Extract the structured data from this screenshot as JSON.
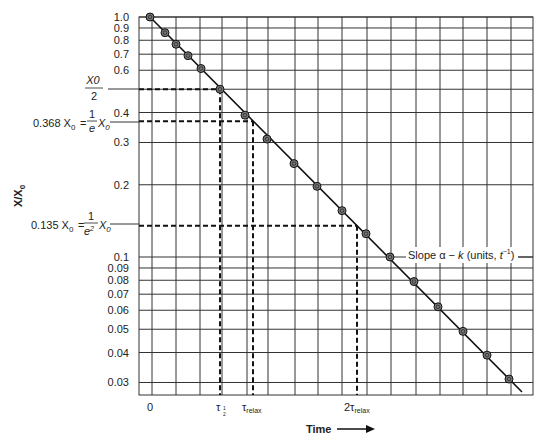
{
  "chart_data": {
    "type": "line",
    "title": "",
    "xlabel": "Time",
    "ylabel": "X/X0",
    "yscale": "log",
    "ylim": [
      0.027,
      1.0
    ],
    "grid": true,
    "y_ticks": [
      "1.0",
      "0.9",
      "0.8",
      "0.7",
      "0.6",
      "0.4",
      "0.3",
      "0.2",
      "0.1",
      "0.09",
      "0.08",
      "0.07",
      "0.06",
      "0.05",
      "0.04",
      "0.03"
    ],
    "y_tick_values": [
      1.0,
      0.9,
      0.8,
      0.7,
      0.6,
      0.4,
      0.3,
      0.2,
      0.1,
      0.09,
      0.08,
      0.07,
      0.06,
      0.05,
      0.04,
      0.03
    ],
    "x_ticks": [
      "0",
      "τ1/2",
      "τrelax",
      "2τrelax"
    ],
    "annotations": {
      "half": {
        "label_num": "X0",
        "label_den": "2",
        "value": 0.5
      },
      "one_over_e": {
        "prefix": "0.368 X",
        "sub": "0",
        "eq": "=",
        "frac_num": "1",
        "frac_den": "e",
        "suffix": "X",
        "suffix_sub": "0",
        "value": 0.368
      },
      "one_over_e2": {
        "prefix": "0.135 X",
        "sub": "0",
        "eq": "=",
        "frac_num": "1",
        "frac_den": "e",
        "frac_den_sup": "2",
        "suffix": "X",
        "suffix_sub": "0",
        "value": 0.135
      },
      "slope": {
        "text_a": "Slope ",
        "alpha": "α",
        "minus": " − ",
        "k": "k",
        "units": " (units, ",
        "t": "t",
        "exp": "−1",
        "close": ")"
      }
    },
    "x_tick_labels": {
      "zero": "0",
      "tau_half": "τ",
      "tau_half_sub_num": "1",
      "tau_half_sub_den": "2",
      "tau_relax": "τ",
      "tau_relax_sub": "relax",
      "two_tau_relax": "2τ",
      "two_tau_relax_sub": "relax"
    },
    "xlabel_arrow": "→",
    "series": [
      {
        "name": "X/X0 (exponential decay)",
        "x_relative": [
          0,
          0.06,
          0.11,
          0.16,
          0.21,
          0.29,
          0.39,
          0.48,
          0.59,
          0.68,
          0.78,
          0.88,
          0.97,
          1.07,
          1.17,
          1.27,
          1.37,
          1.46
        ],
        "values": [
          1.0,
          0.86,
          0.77,
          0.69,
          0.61,
          0.5,
          0.39,
          0.31,
          0.245,
          0.197,
          0.156,
          0.125,
          0.1,
          0.079,
          0.062,
          0.049,
          0.039,
          0.031
        ]
      }
    ],
    "reference_lines": [
      {
        "label": "X0/2",
        "y": 0.5,
        "x": "τ1/2"
      },
      {
        "label": "0.368 X0 = (1/e) X0",
        "y": 0.368,
        "x": "τrelax"
      },
      {
        "label": "0.135 X0 = (1/e²) X0",
        "y": 0.135,
        "x": "2τrelax"
      }
    ]
  }
}
